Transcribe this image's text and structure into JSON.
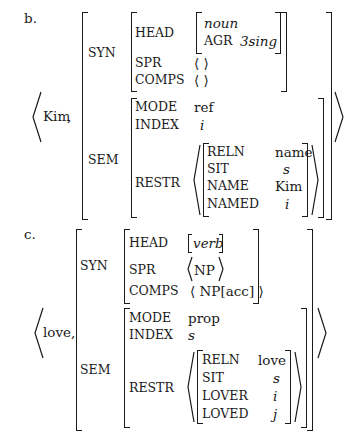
{
  "examples": [
    {
      "label": "b.",
      "word": "Kim",
      "separator": ",",
      "syn": {
        "label": "SYN",
        "head": {
          "label": "HEAD",
          "type": "noun",
          "agr_label": "AGR",
          "agr_value": "3sing"
        },
        "spr": {
          "label": "SPR",
          "value": "⟨ ⟩"
        },
        "comps": {
          "label": "COMPS",
          "value": "⟨ ⟩"
        }
      },
      "sem": {
        "label": "SEM",
        "mode": {
          "label": "MODE",
          "value": "ref"
        },
        "index": {
          "label": "INDEX",
          "value": "i"
        },
        "restr": {
          "label": "RESTR",
          "features": [
            {
              "label": "RELN",
              "value": "name"
            },
            {
              "label": "SIT",
              "value": "s"
            },
            {
              "label": "NAME",
              "value": "Kim"
            },
            {
              "label": "NAMED",
              "value": "i"
            }
          ]
        }
      }
    },
    {
      "label": "c.",
      "word": "love,",
      "syn": {
        "label": "SYN",
        "head": {
          "label": "HEAD",
          "value": "verb"
        },
        "spr": {
          "label": "SPR",
          "value": "NP"
        },
        "comps": {
          "label": "COMPS",
          "value": "⟨ NP[acc] ⟩"
        }
      },
      "sem": {
        "label": "SEM",
        "mode": {
          "label": "MODE",
          "value": "prop"
        },
        "index": {
          "label": "INDEX",
          "value": "s"
        },
        "restr": {
          "label": "RESTR",
          "features": [
            {
              "label": "RELN",
              "value": "love"
            },
            {
              "label": "SIT",
              "value": "s"
            },
            {
              "label": "LOVER",
              "value": "i"
            },
            {
              "label": "LOVED",
              "value": "j"
            }
          ]
        }
      }
    }
  ]
}
